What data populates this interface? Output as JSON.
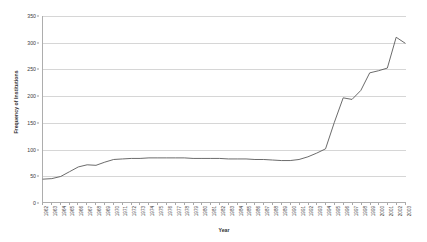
{
  "chart_data": {
    "type": "line",
    "title": "",
    "xlabel": "Year",
    "ylabel": "Frequency of Institutions",
    "ylim": [
      0,
      350
    ],
    "ytick_step": 50,
    "yticks": [
      "0",
      "50",
      "100",
      "150",
      "200",
      "250",
      "300",
      "350"
    ],
    "grid": true,
    "legend": "none",
    "line_color": "#595959",
    "categories": [
      "1962",
      "1963",
      "1964",
      "1965",
      "1966",
      "1967",
      "1968",
      "1969",
      "1970",
      "1971",
      "1972",
      "1973",
      "1974",
      "1975",
      "1976",
      "1977",
      "1978",
      "1979",
      "1980",
      "1981",
      "1982",
      "1983",
      "1984",
      "1985",
      "1986",
      "1987",
      "1988",
      "1989",
      "1990",
      "1991",
      "1992",
      "1993",
      "1994",
      "1995",
      "1996",
      "1997",
      "1998",
      "1999",
      "2000",
      "2001",
      "2002",
      "2003"
    ],
    "series": [
      {
        "name": "Frequency of Institutions",
        "values": [
          43,
          44,
          48,
          57,
          66,
          70,
          69,
          75,
          80,
          81,
          82,
          82,
          83,
          83,
          83,
          83,
          83,
          82,
          82,
          82,
          82,
          81,
          81,
          81,
          80,
          80,
          79,
          78,
          78,
          80,
          85,
          92,
          100,
          150,
          196,
          193,
          210,
          243,
          247,
          252,
          310,
          299
        ]
      }
    ]
  }
}
